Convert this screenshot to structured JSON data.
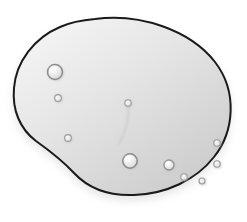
{
  "image": {
    "title": "Kidney-shaped gray blob illustration",
    "alt_text": "Grayscale drawing of a bean or kidney shaped object with a black outline, soft gradient fill, drop shadow, and scattered small circular pits on its surface",
    "width": 247,
    "height": 222,
    "background_color": "#ffffff"
  },
  "blob": {
    "name": "bean-shape",
    "outline_color": "#1a1a1a",
    "outline_width": 2.0,
    "fill_light": "#f2f2f2",
    "fill_mid": "#dcdcdc",
    "fill_dark": "#c7c7c7",
    "shadow_color": "#d6d6d6",
    "shadow_opacity": 0.65,
    "path": "M 95 19 C 140 13, 190 30, 215 62 C 238 92, 234 132, 214 157 C 196 180, 166 194, 134 195 C 108 196, 88 188, 74 173 C 62 160, 50 151, 36 141 C 20 129, 12 110, 14 88 C 16 62, 34 38, 60 27 C 71 22, 83 20, 95 19 Z",
    "shadow_path": "M 95 24 C 140 18, 190 35, 215 67 C 238 97, 234 137, 214 162 C 196 185, 166 199, 134 200 C 108 201, 88 193, 74 178 C 62 165, 50 156, 36 146 C 20 134, 12 115, 14 93 C 16 67, 34 43, 60 32 C 71 27, 83 25, 95 24 Z",
    "crease_path": "M 128 103 C 130 118, 126 132, 118 145"
  },
  "pits": [
    {
      "name": "pit-top-left-large",
      "cx": 55,
      "cy": 72,
      "r": 7.5,
      "stroke": "#8c8c8c",
      "size": "large"
    },
    {
      "name": "pit-upper-left-small",
      "cx": 58,
      "cy": 98,
      "r": 3.4,
      "stroke": "#9a9a9a",
      "size": "small"
    },
    {
      "name": "pit-center",
      "cx": 128,
      "cy": 103,
      "r": 3.2,
      "stroke": "#9a9a9a",
      "size": "small"
    },
    {
      "name": "pit-lower-left",
      "cx": 68,
      "cy": 138,
      "r": 3.4,
      "stroke": "#9a9a9a",
      "size": "small"
    },
    {
      "name": "pit-bottom-center-large",
      "cx": 130,
      "cy": 161,
      "r": 7.2,
      "stroke": "#8a8a8a",
      "size": "large"
    },
    {
      "name": "pit-bottom-right-medium",
      "cx": 169,
      "cy": 165,
      "r": 5.0,
      "stroke": "#909090",
      "size": "medium"
    },
    {
      "name": "pit-bottom-right-small-a",
      "cx": 184,
      "cy": 177,
      "r": 3.2,
      "stroke": "#9a9a9a",
      "size": "small"
    },
    {
      "name": "pit-bottom-right-small-b",
      "cx": 202,
      "cy": 181,
      "r": 3.0,
      "stroke": "#9a9a9a",
      "size": "small"
    },
    {
      "name": "pit-right-edge-upper",
      "cx": 217,
      "cy": 143,
      "r": 3.2,
      "stroke": "#9a9a9a",
      "size": "small"
    },
    {
      "name": "pit-right-edge-lower",
      "cx": 217,
      "cy": 164,
      "r": 3.2,
      "stroke": "#9a9a9a",
      "size": "small"
    }
  ]
}
